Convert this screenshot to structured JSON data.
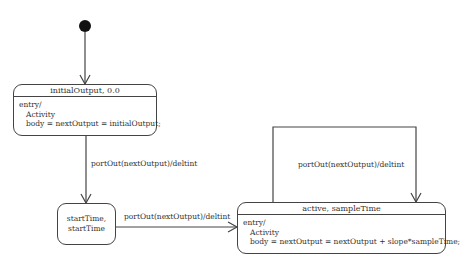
{
  "diagram": {
    "type": "state-machine",
    "initial_state": {
      "target": "initialOutput"
    },
    "states": [
      {
        "id": "initialOutput",
        "header": "initialOutput, 0.0",
        "body": {
          "line1": "entry/",
          "line2": "Activity",
          "line3": "body = nextOutput = initialOutput;"
        }
      },
      {
        "id": "startTime",
        "line1": "startTime,",
        "line2": "startTime"
      },
      {
        "id": "active",
        "header": "active, sampleTime",
        "body": {
          "line1": "entry/",
          "line2": "Activity",
          "line3": "body = nextOutput = nextOutput + slope*sampleTime;"
        }
      }
    ],
    "transitions": [
      {
        "from": "initialOutput",
        "to": "startTime",
        "label": "portOut(nextOutput)/deltint"
      },
      {
        "from": "startTime",
        "to": "active",
        "label": "portOut(nextOutput)/deltint"
      },
      {
        "from": "active",
        "to": "active",
        "label": "portOut(nextOutput)/deltint"
      }
    ]
  }
}
